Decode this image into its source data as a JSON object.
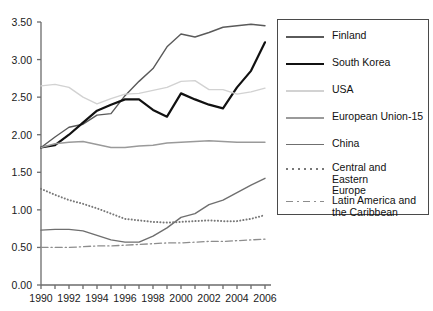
{
  "chart_data": {
    "type": "line",
    "title": "",
    "xlabel": "",
    "ylabel": "",
    "xlim": [
      1990,
      2006
    ],
    "ylim": [
      0.0,
      3.5
    ],
    "grid": false,
    "legend_position": "right",
    "x": [
      1990,
      1991,
      1992,
      1993,
      1994,
      1995,
      1996,
      1997,
      1998,
      1999,
      2000,
      2001,
      2002,
      2003,
      2004,
      2005,
      2006
    ],
    "xtick_labels": [
      "1990",
      "1992",
      "1994",
      "1996",
      "1998",
      "2000",
      "2002",
      "2004",
      "2006"
    ],
    "ytick_labels": [
      "0.00",
      "0.50",
      "1.00",
      "1.50",
      "2.00",
      "2.50",
      "3.00",
      "3.50"
    ],
    "series": [
      {
        "name": "Finland",
        "color": "#5a5a5a",
        "style": "solid",
        "values": [
          1.83,
          1.97,
          2.1,
          2.14,
          2.26,
          2.28,
          2.52,
          2.71,
          2.88,
          3.17,
          3.34,
          3.3,
          3.36,
          3.43,
          3.45,
          3.47,
          3.45
        ]
      },
      {
        "name": "South Korea",
        "color": "#111111",
        "style": "solid",
        "values": [
          1.83,
          1.86,
          2.0,
          2.16,
          2.32,
          2.4,
          2.47,
          2.47,
          2.33,
          2.24,
          2.55,
          2.47,
          2.4,
          2.35,
          2.63,
          2.85,
          3.23
        ]
      },
      {
        "name": "USA",
        "color": "#d2d2d2",
        "style": "solid",
        "values": [
          2.65,
          2.67,
          2.63,
          2.5,
          2.41,
          2.48,
          2.54,
          2.55,
          2.59,
          2.63,
          2.71,
          2.72,
          2.6,
          2.6,
          2.54,
          2.57,
          2.62
        ]
      },
      {
        "name": "European Union-15",
        "color": "#9a9a9a",
        "style": "solid",
        "values": [
          1.83,
          1.88,
          1.9,
          1.91,
          1.87,
          1.83,
          1.83,
          1.85,
          1.86,
          1.89,
          1.9,
          1.91,
          1.92,
          1.91,
          1.9,
          1.9,
          1.9
        ]
      },
      {
        "name": "China",
        "color": "#6f6f6f",
        "style": "solid",
        "values": [
          0.73,
          0.74,
          0.74,
          0.72,
          0.66,
          0.6,
          0.57,
          0.57,
          0.65,
          0.76,
          0.9,
          0.95,
          1.07,
          1.13,
          1.23,
          1.33,
          1.42
        ]
      },
      {
        "name": "Central and Eastern Europe",
        "color": "#787878",
        "style": "dotted",
        "values": [
          1.28,
          1.2,
          1.13,
          1.08,
          1.02,
          0.95,
          0.88,
          0.86,
          0.84,
          0.83,
          0.84,
          0.85,
          0.86,
          0.85,
          0.85,
          0.88,
          0.93
        ]
      },
      {
        "name": "Latin America and the Caribbean",
        "color": "#8d8d8d",
        "style": "dashdot",
        "values": [
          0.5,
          0.5,
          0.5,
          0.51,
          0.52,
          0.52,
          0.53,
          0.54,
          0.55,
          0.56,
          0.56,
          0.57,
          0.58,
          0.58,
          0.59,
          0.6,
          0.61
        ]
      }
    ]
  },
  "legend": {
    "items": [
      {
        "label": "Finland",
        "swatch": "solid-dark-gray"
      },
      {
        "label": "South Korea",
        "swatch": "solid-black"
      },
      {
        "label": "USA",
        "swatch": "solid-light-gray"
      },
      {
        "label": "European Union-15",
        "swatch": "solid-mid-gray"
      },
      {
        "label": "China",
        "swatch": "solid-gray"
      },
      {
        "label": "Central and Eastern\nEurope",
        "swatch": "dotted-gray"
      },
      {
        "label": "Latin America and\nthe Caribbean",
        "swatch": "dashdot-gray"
      }
    ]
  }
}
